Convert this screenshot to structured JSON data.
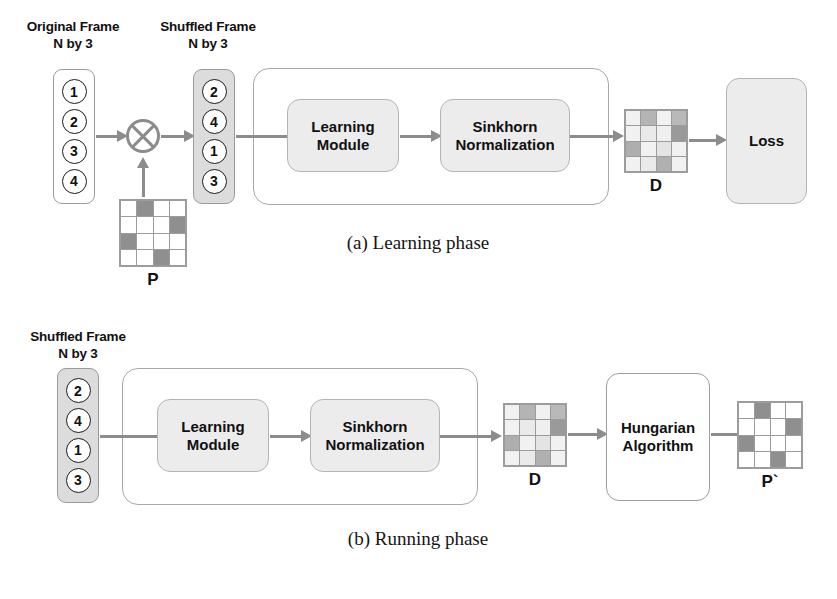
{
  "figure": {
    "panels": [
      {
        "id": "learning",
        "caption": "(a) Learning phase",
        "headers": [
          {
            "line1": "Original Frame",
            "line2": "N by 3"
          },
          {
            "line1": "Shuffled Frame",
            "line2": "N by 3"
          }
        ],
        "original_frame": {
          "values": [
            "1",
            "2",
            "3",
            "4"
          ],
          "fill": "#ffffff"
        },
        "shuffled_frame": {
          "values": [
            "2",
            "4",
            "1",
            "3"
          ],
          "fill": "#dcdcdc"
        },
        "operator": {
          "symbol": "circle-times",
          "label": "⊗"
        },
        "permutation_matrix": {
          "label": "P",
          "rows": 4,
          "cols": 4,
          "cells": [
            [
              "#ffffff",
              "#8f8f8f",
              "#ffffff",
              "#ffffff"
            ],
            [
              "#ffffff",
              "#ffffff",
              "#ffffff",
              "#8f8f8f"
            ],
            [
              "#8f8f8f",
              "#ffffff",
              "#ffffff",
              "#ffffff"
            ],
            [
              "#ffffff",
              "#ffffff",
              "#8f8f8f",
              "#ffffff"
            ]
          ]
        },
        "pipeline": {
          "blocks": [
            {
              "line1": "Learning",
              "line2": "Module"
            },
            {
              "line1": "Sinkhorn",
              "line2": "Normalization"
            }
          ]
        },
        "doubly_stochastic_matrix": {
          "label": "D",
          "rows": 4,
          "cols": 4,
          "cells": [
            [
              "#f1f1f1",
              "#b4b4b4",
              "#f1f1f1",
              "#b9b9b9"
            ],
            [
              "#f1f1f1",
              "#eaeaea",
              "#efefef",
              "#9a9a9a"
            ],
            [
              "#aeaeae",
              "#f1f1f1",
              "#e4e4e4",
              "#f1f1f1"
            ],
            [
              "#f1f1f1",
              "#eaeaea",
              "#b0b0b0",
              "#f1f1f1"
            ]
          ]
        },
        "loss_block": {
          "label": "Loss"
        }
      },
      {
        "id": "running",
        "caption": "(b) Running phase",
        "headers": [
          {
            "line1": "Shuffled Frame",
            "line2": "N by 3"
          }
        ],
        "shuffled_frame": {
          "values": [
            "2",
            "4",
            "1",
            "3"
          ],
          "fill": "#dcdcdc"
        },
        "pipeline": {
          "blocks": [
            {
              "line1": "Learning",
              "line2": "Module"
            },
            {
              "line1": "Sinkhorn",
              "line2": "Normalization"
            }
          ]
        },
        "doubly_stochastic_matrix": {
          "label": "D",
          "rows": 4,
          "cols": 4,
          "cells": [
            [
              "#f1f1f1",
              "#b4b4b4",
              "#f1f1f1",
              "#b9b9b9"
            ],
            [
              "#f1f1f1",
              "#eaeaea",
              "#efefef",
              "#9a9a9a"
            ],
            [
              "#aeaeae",
              "#f1f1f1",
              "#e4e4e4",
              "#f1f1f1"
            ],
            [
              "#f1f1f1",
              "#eaeaea",
              "#b0b0b0",
              "#f1f1f1"
            ]
          ]
        },
        "hungarian_block": {
          "line1": "Hungarian",
          "line2": "Algorithm"
        },
        "predicted_permutation_matrix": {
          "label": "P`",
          "rows": 4,
          "cols": 4,
          "cells": [
            [
              "#ffffff",
              "#8f8f8f",
              "#ffffff",
              "#ffffff"
            ],
            [
              "#ffffff",
              "#ffffff",
              "#ffffff",
              "#8f8f8f"
            ],
            [
              "#8f8f8f",
              "#ffffff",
              "#ffffff",
              "#ffffff"
            ],
            [
              "#ffffff",
              "#ffffff",
              "#8f8f8f",
              "#ffffff"
            ]
          ]
        }
      }
    ],
    "colors": {
      "arrow": "#8c8c8c",
      "box_shaded": "#ececec",
      "box_border": "#b4b4b4",
      "frame_gray": "#dcdcdc",
      "matrix_dark": "#8f8f8f",
      "text": "#111111"
    }
  }
}
